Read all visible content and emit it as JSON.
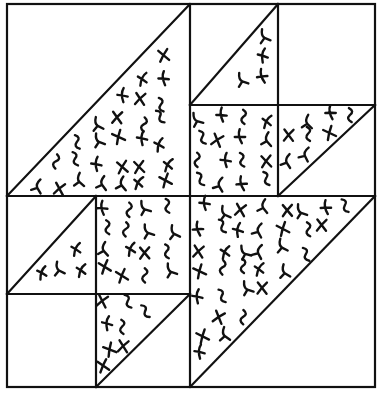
{
  "diagram": {
    "title": "",
    "type": "quilt-block-pattern",
    "ink_color": "#111111",
    "background_color": "#ffffff",
    "frame": {
      "x1": 7,
      "y1": 4,
      "x2": 375,
      "y2": 387
    },
    "grid_lines": [
      {
        "name": "center-vertical",
        "x1": 190,
        "y1": 4,
        "x2": 190,
        "y2": 387
      },
      {
        "name": "center-horizontal",
        "x1": 7,
        "y1": 196,
        "x2": 375,
        "y2": 196
      },
      {
        "name": "tr-vertical",
        "x1": 278,
        "y1": 4,
        "x2": 278,
        "y2": 196
      },
      {
        "name": "tr-horizontal",
        "x1": 190,
        "y1": 105,
        "x2": 375,
        "y2": 105
      },
      {
        "name": "bl-vertical",
        "x1": 96,
        "y1": 196,
        "x2": 96,
        "y2": 387
      },
      {
        "name": "bl-horizontal",
        "x1": 7,
        "y1": 294,
        "x2": 190,
        "y2": 294
      }
    ],
    "diagonals": [
      {
        "name": "tl-large",
        "x1": 7,
        "y1": 196,
        "x2": 190,
        "y2": 4
      },
      {
        "name": "tr-small-a",
        "x1": 190,
        "y1": 105,
        "x2": 278,
        "y2": 4
      },
      {
        "name": "tr-small-b",
        "x1": 278,
        "y1": 196,
        "x2": 375,
        "y2": 105
      },
      {
        "name": "bl-small-a",
        "x1": 7,
        "y1": 294,
        "x2": 96,
        "y2": 196
      },
      {
        "name": "bl-small-b",
        "x1": 96,
        "y1": 387,
        "x2": 190,
        "y2": 294
      },
      {
        "name": "br-large",
        "x1": 190,
        "y1": 387,
        "x2": 375,
        "y2": 196
      }
    ],
    "hatched_regions": [
      {
        "name": "tl-lower-right-triangle",
        "points": "190,4 190,196 7,196"
      },
      {
        "name": "tr-tl-lower-right-triangle",
        "points": "278,4 278,105 190,105"
      },
      {
        "name": "tr-bl-square",
        "points": "190,105 278,105 278,196 190,196"
      },
      {
        "name": "tr-br-upper-left-triangle",
        "points": "278,105 375,105 278,196"
      },
      {
        "name": "bl-tl-lower-right-triangle",
        "points": "96,196 96,294 7,294"
      },
      {
        "name": "bl-tr-square",
        "points": "96,196 190,196 190,294 96,294"
      },
      {
        "name": "bl-br-upper-left-triangle",
        "points": "96,294 190,294 96,387"
      },
      {
        "name": "br-upper-left-triangle",
        "points": "190,196 375,196 190,387"
      }
    ]
  }
}
